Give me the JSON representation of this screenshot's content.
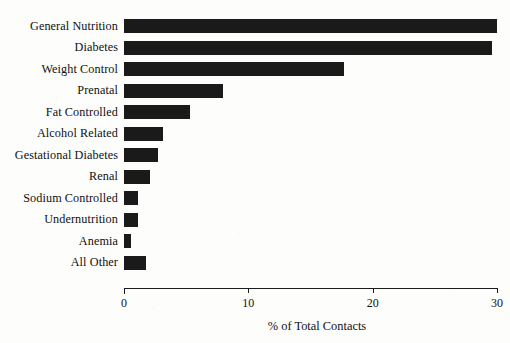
{
  "chart_data": {
    "type": "bar",
    "orientation": "horizontal",
    "title": "",
    "subtitle": "",
    "xlabel": "% of Total Contacts",
    "ylabel": "",
    "xlim": [
      0,
      30
    ],
    "xticks": [
      0,
      10,
      20,
      30
    ],
    "xtick_labels": [
      "0",
      "10",
      "20",
      "30"
    ],
    "grid": false,
    "legend": null,
    "bar_color": "#1a1a1a",
    "axis_color": "#1b1b1b",
    "background_color": "#fdfdfc",
    "categories": [
      "General Nutrition",
      "Diabetes",
      "Weight Control",
      "Prenatal",
      "Fat Controlled",
      "Alcohol Related",
      "Gestational Diabetes",
      "Renal",
      "Sodium Controlled",
      "Undernutrition",
      "Anemia",
      "All Other"
    ],
    "values": [
      30.0,
      29.6,
      17.7,
      8.0,
      5.3,
      3.1,
      2.7,
      2.1,
      1.1,
      1.1,
      0.6,
      1.8
    ]
  }
}
